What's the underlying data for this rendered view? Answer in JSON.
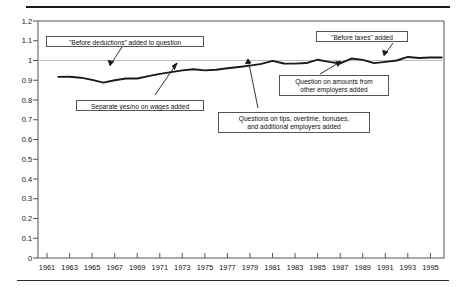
{
  "chart_data": {
    "type": "line",
    "title": "",
    "xlabel": "",
    "ylabel": "",
    "xlim": [
      1960.2,
      1996.2
    ],
    "ylim": [
      0,
      1.2
    ],
    "grid": false,
    "legend": "none",
    "reference_lines": [
      {
        "axis": "y",
        "value": 1.0,
        "style": "light-gray-solid"
      }
    ],
    "yticks": [
      "1.2",
      "1.1",
      "1",
      "0.9",
      "0.8",
      "0.7",
      "0.6",
      "0.5",
      "0.4",
      "0.3",
      "0.2",
      "0.1",
      "0"
    ],
    "ytick_values": [
      1.2,
      1.1,
      1.0,
      0.9,
      0.8,
      0.7,
      0.6,
      0.5,
      0.4,
      0.3,
      0.2,
      0.1,
      0
    ],
    "xticks": [
      "1961",
      "1963",
      "1965",
      "1967",
      "1969",
      "1971",
      "1973",
      "1975",
      "1977",
      "1979",
      "1981",
      "1983",
      "1985",
      "1987",
      "1989",
      "1991",
      "1993",
      "1995"
    ],
    "xtick_values": [
      1961,
      1963,
      1965,
      1967,
      1969,
      1971,
      1973,
      1975,
      1977,
      1979,
      1981,
      1983,
      1985,
      1987,
      1989,
      1991,
      1993,
      1995
    ],
    "series": [
      {
        "name": "Ratio",
        "x": [
          1962,
          1963,
          1964,
          1965,
          1966,
          1967,
          1968,
          1969,
          1970,
          1971,
          1972,
          1973,
          1974,
          1975,
          1976,
          1977,
          1978,
          1979,
          1980,
          1981,
          1982,
          1983,
          1984,
          1985,
          1986,
          1987,
          1988,
          1989,
          1990,
          1991,
          1992,
          1993,
          1994,
          1995,
          1996
        ],
        "values": [
          0.917,
          0.918,
          0.913,
          0.902,
          0.888,
          0.9,
          0.909,
          0.909,
          0.921,
          0.932,
          0.941,
          0.95,
          0.956,
          0.95,
          0.953,
          0.961,
          0.967,
          0.974,
          0.983,
          0.998,
          0.985,
          0.984,
          0.987,
          1.004,
          0.993,
          0.985,
          1.01,
          1.003,
          0.987,
          0.993,
          1.0,
          1.018,
          1.013,
          1.015,
          1.015
        ]
      }
    ],
    "annotations": [
      {
        "id": "before-deductions",
        "text": "\"Before deductions\" added to question",
        "target_x": 1968.2,
        "target_y": 0.909
      },
      {
        "id": "separate-yes-no",
        "text": "Separate yes/no on wages added",
        "target_x": 1974.1,
        "target_y": 0.95
      },
      {
        "id": "tips-overtime-bonuses",
        "text": "Questions on tips, overtime, bonuses,\nand additional employers added",
        "target_x": 1980.8,
        "target_y": 0.99
      },
      {
        "id": "other-employers-amounts",
        "text": "Question on amounts from\nother employers added",
        "target_x": 1989.2,
        "target_y": 0.992
      },
      {
        "id": "before-taxes",
        "text": "\"Before taxes\" added",
        "target_x": 1993.3,
        "target_y": 1.018
      }
    ]
  }
}
